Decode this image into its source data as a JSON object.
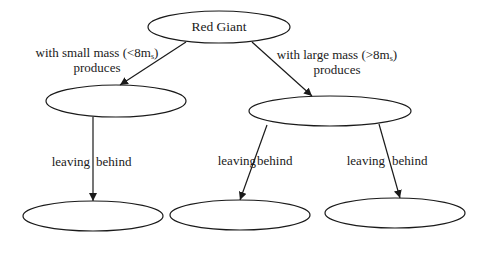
{
  "diagram": {
    "nodes": [
      {
        "id": "red-giant",
        "label": "Red Giant",
        "cx": 219,
        "cy": 27,
        "rx": 71,
        "ry": 16
      },
      {
        "id": "small-mass-product",
        "label": "",
        "cx": 116,
        "cy": 101,
        "rx": 70,
        "ry": 16
      },
      {
        "id": "large-mass-product",
        "label": "",
        "cx": 330,
        "cy": 111,
        "rx": 81,
        "ry": 15
      },
      {
        "id": "small-remnant",
        "label": "",
        "cx": 93,
        "cy": 216,
        "rx": 70,
        "ry": 15
      },
      {
        "id": "large-remnant-1",
        "label": "",
        "cx": 240,
        "cy": 215,
        "rx": 70,
        "ry": 15
      },
      {
        "id": "large-remnant-2",
        "label": "",
        "cx": 395,
        "cy": 213,
        "rx": 70,
        "ry": 15
      }
    ],
    "edges": [
      {
        "from": "red-giant",
        "to": "small-mass-product",
        "label_line1_prefix": "with small mass (<8m",
        "label_sub": "s",
        "label_line1_suffix": ")",
        "label_line2": "produces"
      },
      {
        "from": "red-giant",
        "to": "large-mass-product",
        "label_line1_prefix": "with large mass (>8m",
        "label_sub": "s",
        "label_line1_suffix": ")",
        "label_line2": "produces"
      },
      {
        "from": "small-mass-product",
        "to": "small-remnant",
        "label_left": "leaving",
        "label_right": "behind"
      },
      {
        "from": "large-mass-product",
        "to": "large-remnant-1",
        "label_left": "leaving",
        "label_right": "behind"
      },
      {
        "from": "large-mass-product",
        "to": "large-remnant-2",
        "label_left": "leaving",
        "label_right": "behind"
      }
    ],
    "colors": {
      "stroke": "#1a1a1a",
      "background": "#ffffff"
    }
  }
}
